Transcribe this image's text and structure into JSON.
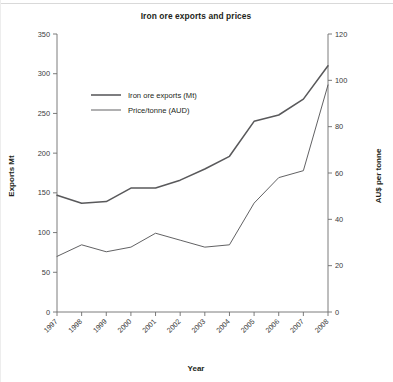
{
  "figure": {
    "title": "Iron ore exports and prices",
    "xlabel": "Year",
    "ylabel_left": "Exports Mt",
    "ylabel_right": "AU$ per tonne"
  },
  "legend": {
    "items": [
      {
        "label": "Iron ore exports (Mt)",
        "style": "thick"
      },
      {
        "label": "Price/tonne (AUD)",
        "style": "thin"
      }
    ]
  },
  "axes": {
    "left_ticks": [
      "0",
      "50",
      "100",
      "150",
      "200",
      "250",
      "300",
      "350"
    ],
    "right_ticks": [
      "0",
      "20",
      "40",
      "60",
      "80",
      "100",
      "120"
    ],
    "x_ticks": [
      "1997",
      "1998",
      "1999",
      "2000",
      "2001",
      "2002",
      "2003",
      "2004",
      "2005",
      "2006",
      "2007",
      "2008"
    ]
  },
  "chart_data": {
    "type": "line",
    "title": "Iron ore exports and prices",
    "xlabel": "Year",
    "ylabel": "Exports Mt",
    "ylabel_secondary": "AU$ per tonne",
    "categories": [
      "1997",
      "1998",
      "1999",
      "2000",
      "2001",
      "2002",
      "2003",
      "2004",
      "2005",
      "2006",
      "2007",
      "2008"
    ],
    "ylim": [
      0,
      350
    ],
    "ylim_secondary": [
      0,
      120
    ],
    "grid": false,
    "legend_position": "upper-left-inside",
    "series": [
      {
        "name": "Iron ore exports (Mt)",
        "axis": "left",
        "unit": "Mt",
        "color": "#59595b",
        "line_width": "thick",
        "values": [
          147,
          137,
          139,
          156,
          156,
          166,
          180,
          196,
          240,
          248,
          268,
          310
        ]
      },
      {
        "name": "Price/tonne (AUD)",
        "axis": "right",
        "unit": "AUD",
        "color": "#59595b",
        "line_width": "thin",
        "values": [
          24,
          29,
          26,
          28,
          34,
          31,
          28,
          29,
          47,
          58,
          61,
          98
        ]
      }
    ]
  }
}
